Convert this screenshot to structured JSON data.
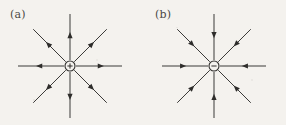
{
  "figure": {
    "type": "vector-field-diagram",
    "background_color": "#f4f2ee",
    "line_color": "#3b3a38",
    "panel_count": 2,
    "rays_per_panel": 8,
    "ray_angles_deg": [
      0,
      45,
      90,
      135,
      180,
      225,
      270,
      315
    ],
    "panels": [
      {
        "id": "a",
        "label": "(a)",
        "center_x": 70,
        "center_y": 66,
        "ray_length": 52,
        "node_radius": 5,
        "node_sign": "+",
        "flow": "outward",
        "meaning": "source"
      },
      {
        "id": "b",
        "label": "(b)",
        "center_x": 214,
        "center_y": 66,
        "ray_length": 52,
        "node_radius": 5,
        "node_sign": "−",
        "flow": "inward",
        "meaning": "sink"
      }
    ]
  }
}
